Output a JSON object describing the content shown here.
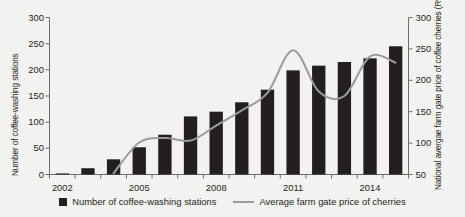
{
  "chart_data": {
    "type": "bar",
    "title": "",
    "subtitle": "",
    "xlabel": "",
    "categories": [
      "2002",
      "2003",
      "2004",
      "2005",
      "2006",
      "2007",
      "2008",
      "2009",
      "2010",
      "2011",
      "2012",
      "2013",
      "2014",
      "2015"
    ],
    "x_tick_labels": [
      "2002",
      "2005",
      "2008",
      "2011",
      "2014"
    ],
    "grid": false,
    "legend_position": "bottom",
    "axes": {
      "left": {
        "label": "Number of coffee-washing stations",
        "ticks": [
          0,
          50,
          100,
          150,
          200,
          250,
          300
        ],
        "ylim": [
          0,
          300
        ]
      },
      "right": {
        "label": "National avergae farm gate price of coffee cherries (Rwanda francs per kg)",
        "ticks": [
          50,
          100,
          150,
          200,
          250,
          300
        ],
        "ylim": [
          50,
          300
        ]
      }
    },
    "series": [
      {
        "name": "Number of coffee-washing stations",
        "type": "bar",
        "axis": "left",
        "color": "#231f20",
        "values": [
          2,
          12,
          29,
          52,
          76,
          111,
          120,
          138,
          162,
          199,
          208,
          215,
          222,
          245
        ]
      },
      {
        "name": "Average farm gate price of cherries",
        "type": "line",
        "axis": "right",
        "color": "#9b9b9b",
        "values": [
          null,
          null,
          52,
          101,
          108,
          104,
          128,
          152,
          180,
          248,
          182,
          175,
          238,
          228
        ]
      }
    ]
  },
  "legend": {
    "items": [
      {
        "label": "Number of coffee-washing stations",
        "marker": "square-swatch"
      },
      {
        "label": "Average farm gate price of cherries",
        "marker": "line-swatch"
      }
    ]
  }
}
